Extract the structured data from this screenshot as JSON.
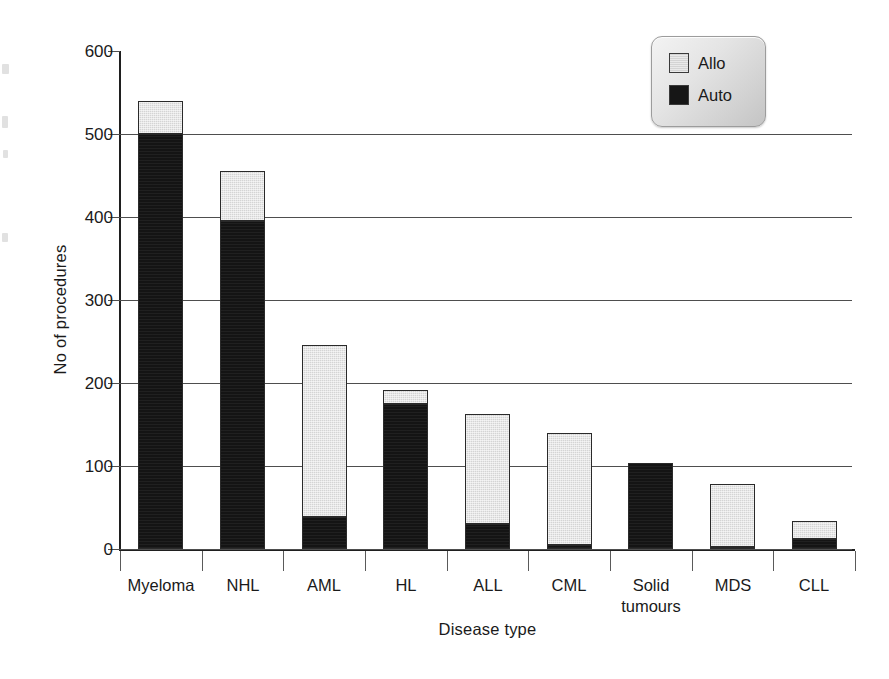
{
  "chart_data": {
    "type": "bar",
    "stacked": true,
    "title": "",
    "xlabel": "Disease type",
    "ylabel": "No of procedures",
    "ylim": [
      0,
      600
    ],
    "yticks": [
      0,
      100,
      200,
      300,
      400,
      500,
      600
    ],
    "ytick_labels": [
      "0",
      "100",
      "200",
      "300",
      "400",
      "500",
      "600"
    ],
    "grid": "horizontal",
    "legend_position": "top-right",
    "categories": [
      "Myeloma",
      "NHL",
      "AML",
      "HL",
      "ALL",
      "CML",
      "Solid\ntumours",
      "MDS",
      "CLL"
    ],
    "series": [
      {
        "name": "Auto",
        "color": "#141414",
        "values": [
          500,
          395,
          38,
          175,
          30,
          5,
          104,
          3,
          12
        ]
      },
      {
        "name": "Allo",
        "color": "#d4d4d4",
        "values": [
          40,
          60,
          208,
          16,
          133,
          135,
          0,
          75,
          22
        ]
      }
    ],
    "totals": [
      540,
      455,
      246,
      191,
      163,
      140,
      104,
      78,
      34
    ]
  },
  "legend": {
    "entries": [
      {
        "label": "Allo",
        "swatch": "allo"
      },
      {
        "label": "Auto",
        "swatch": "auto"
      }
    ]
  }
}
